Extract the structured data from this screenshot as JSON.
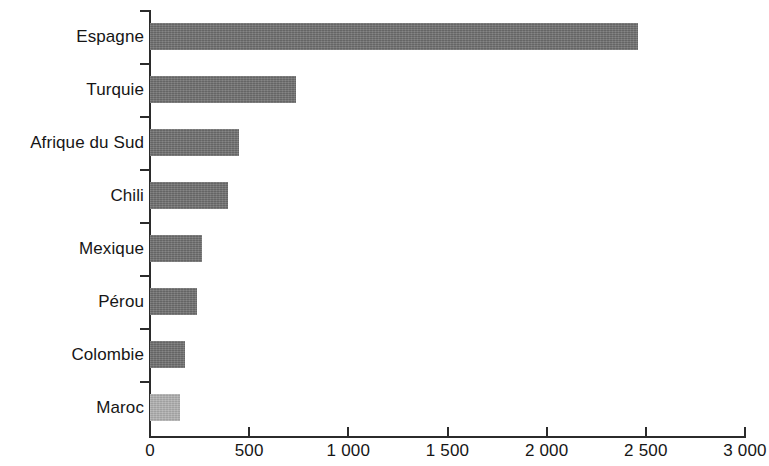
{
  "chart_data": {
    "type": "bar",
    "orientation": "horizontal",
    "title": "",
    "subtitle": "",
    "xlabel": "",
    "ylabel": "",
    "categories": [
      "Espagne",
      "Turquie",
      "Afrique du Sud",
      "Chili",
      "Mexique",
      "Pérou",
      "Colombie",
      "Maroc"
    ],
    "values": [
      2460,
      734,
      450,
      395,
      263,
      238,
      177,
      152
    ],
    "series": [
      {
        "name": "",
        "values": [
          2460,
          734,
          450,
          395,
          263,
          238,
          177,
          152
        ]
      }
    ],
    "bar_colors": [
      "#6e6e6e",
      "#6e6e6e",
      "#6e6e6e",
      "#6e6e6e",
      "#6e6e6e",
      "#6e6e6e",
      "#6e6e6e",
      "#b0b0b0"
    ],
    "xlim": [
      0,
      3000
    ],
    "xticks": [
      0,
      500,
      1000,
      1500,
      2000,
      2500,
      3000
    ],
    "xtick_labels": [
      "0",
      "500",
      "1 000",
      "1 500",
      "2 000",
      "2 500",
      "3 000"
    ],
    "grid": false,
    "legend": false,
    "legend_position": "none",
    "annotations": []
  },
  "axis": {
    "accent_color": "#2b2b2b",
    "bar_color": "#6e6e6e",
    "bar_color_highlight": "#b0b0b0",
    "background": "#ffffff"
  }
}
